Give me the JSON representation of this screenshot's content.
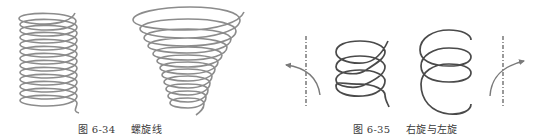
{
  "figures": [
    {
      "id": "fig-6-34",
      "caption_label": "图 6-34",
      "caption_title": "螺旋线",
      "illustrations": [
        {
          "type": "cylindrical-helix",
          "turns": 7,
          "stroke_color": "#8c8c8c"
        },
        {
          "type": "conical-helix",
          "turns": 7,
          "stroke_color": "#8c8c8c"
        }
      ]
    },
    {
      "id": "fig-6-35",
      "caption_label": "图 6-35",
      "caption_title": "右旋与左旋",
      "illustrations": [
        {
          "type": "axis-with-rotation-arrow",
          "arrow_direction": "left",
          "stroke_color": "#7a7a7a"
        },
        {
          "type": "right-hand-helix",
          "turns": 3,
          "stroke_color": "#4a4a4a"
        },
        {
          "type": "left-hand-helix",
          "turns": 3,
          "stroke_color": "#4a4a4a"
        },
        {
          "type": "axis-with-rotation-arrow",
          "arrow_direction": "right",
          "stroke_color": "#7a7a7a"
        }
      ]
    }
  ]
}
